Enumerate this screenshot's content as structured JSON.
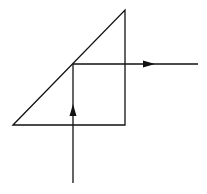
{
  "diagram": {
    "background": "#ffffff",
    "stroke": "#111111",
    "prism": {
      "vertices": [
        [
          13,
          125
        ],
        [
          125,
          10
        ],
        [
          125,
          125
        ]
      ]
    },
    "incident_ray": {
      "from": [
        73,
        183
      ],
      "to": [
        73,
        64
      ],
      "arrow_at": [
        73,
        110
      ],
      "direction": "up"
    },
    "reflected_ray": {
      "from": [
        73,
        64
      ],
      "to": [
        198,
        64
      ],
      "arrow_at": [
        150,
        64
      ],
      "direction": "right"
    }
  }
}
